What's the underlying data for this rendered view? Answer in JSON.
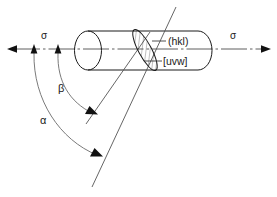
{
  "figure": {
    "background_color": "#ffffff",
    "line_color": "#1a1a1a",
    "arc_color": "#6b6b6b"
  },
  "labels": {
    "sigma_left": "σ",
    "sigma_right": "σ",
    "alpha": "α",
    "beta": "β",
    "plane_index": "(hkl)",
    "direction_index": "[uvw]"
  },
  "geometry": {
    "axis_y": 49,
    "axis_start_x": 8,
    "axis_end_x": 271,
    "cylinder_left_x": 75,
    "cylinder_right_x": 212,
    "cylinder_top_y": 31,
    "cylinder_bottom_y": 70,
    "left_cap_rx": 13,
    "right_cap_rx": 14,
    "grain_center_x": 145,
    "grain_center_y": 50,
    "grain_tilt_deg": -28,
    "alpha_anchor_x": 34,
    "beta_anchor_x": 58,
    "alpha_arrow_x": 98,
    "alpha_arrow_y": 152,
    "beta_arrow_x": 93,
    "beta_arrow_y": 110
  }
}
